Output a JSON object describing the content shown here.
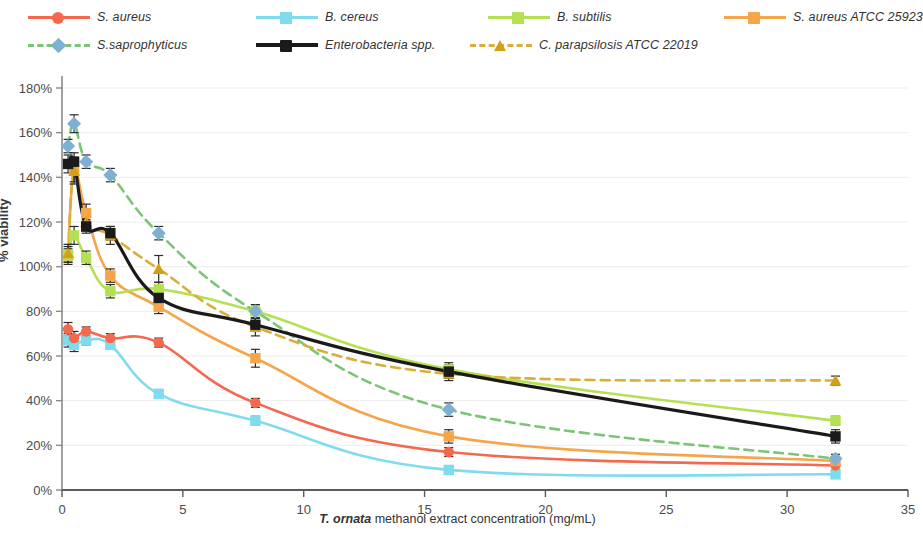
{
  "chart_data": {
    "type": "line",
    "title": "",
    "xlabel": "T. ornata methanol extract concentration (mg/mL)",
    "ylabel": "% viability",
    "xlim": [
      0,
      35
    ],
    "ylim": [
      0,
      180
    ],
    "xticks": [
      0,
      5,
      10,
      15,
      20,
      25,
      30,
      35
    ],
    "xtick_labels": [
      "0",
      "5",
      "10",
      "15",
      "20",
      "25",
      "30",
      "35"
    ],
    "yticks": [
      0,
      20,
      40,
      60,
      80,
      100,
      120,
      140,
      160,
      180
    ],
    "ytick_labels": [
      "0%",
      "20%",
      "40%",
      "60%",
      "80%",
      "100%",
      "120%",
      "140%",
      "160%",
      "180%"
    ],
    "grid": "horizontal",
    "legend_position": "top",
    "x": [
      0.25,
      0.5,
      1,
      2,
      4,
      8,
      16,
      32
    ],
    "series": [
      {
        "name": "S. aureus",
        "color": "#F4694E",
        "marker": "circle",
        "line": "solid",
        "values": [
          72,
          68,
          71,
          68,
          66,
          39,
          17,
          11
        ],
        "errors": [
          3,
          3,
          2,
          2,
          2,
          2,
          2,
          2
        ]
      },
      {
        "name": "B. cereus",
        "color": "#7FDCEF",
        "marker": "square",
        "line": "solid",
        "values": [
          67,
          65,
          67,
          65,
          43,
          31,
          9,
          7
        ],
        "errors": [
          3,
          3,
          2,
          2,
          2,
          2,
          1,
          1
        ]
      },
      {
        "name": "B. subtilis",
        "color": "#B5E053",
        "marker": "square",
        "line": "solid",
        "values": [
          105,
          114,
          104,
          89,
          90,
          80,
          54,
          31
        ],
        "errors": [
          3,
          4,
          3,
          3,
          3,
          3,
          3,
          2
        ]
      },
      {
        "name": "S. aureus ATCC 25923",
        "color": "#F5A64B",
        "marker": "square",
        "line": "solid",
        "values": [
          105,
          143,
          124,
          96,
          82,
          59,
          24,
          13
        ],
        "errors": [
          4,
          5,
          4,
          3,
          3,
          4,
          3,
          2
        ]
      },
      {
        "name": "S.saprophyticus",
        "color": "#7CC576",
        "marker_color": "#7FB0D4",
        "marker": "diamond",
        "line": "dashed",
        "values": [
          154,
          164,
          147,
          141,
          115,
          80,
          36,
          14
        ],
        "errors": [
          3,
          4,
          3,
          3,
          3,
          3,
          3,
          2
        ]
      },
      {
        "name": "Enterobacteria spp.",
        "color": "#1A1A1A",
        "marker": "square",
        "line": "solid",
        "values": [
          146,
          147,
          118,
          115,
          86,
          74,
          53,
          24
        ],
        "errors": [
          4,
          4,
          3,
          3,
          3,
          3,
          3,
          3
        ]
      },
      {
        "name": "C. parapsilosis ATCC 22019",
        "color": "#D9AE3A",
        "marker_color": "#D4A017",
        "marker": "triangle",
        "line": "dashed",
        "values": [
          106,
          143,
          120,
          114,
          99,
          73,
          52,
          49
        ],
        "errors": [
          4,
          6,
          4,
          4,
          6,
          4,
          3,
          2
        ]
      }
    ]
  },
  "legend": {
    "items": [
      {
        "label": "S. aureus",
        "name": "legend-s-aureus"
      },
      {
        "label": "B. cereus",
        "name": "legend-b-cereus"
      },
      {
        "label": "B. subtilis",
        "name": "legend-b-subtilis"
      },
      {
        "label": "S. aureus ATCC 25923",
        "name": "legend-s-aureus-atcc-25923"
      },
      {
        "label": "S.saprophyticus",
        "name": "legend-s-saprophyticus"
      },
      {
        "label": "Enterobacteria spp.",
        "name": "legend-enterobacteria-spp"
      },
      {
        "label": "C. parapsilosis ATCC 22019",
        "name": "legend-c-parapsilosis-atcc-22019"
      }
    ]
  },
  "axes": {
    "y_title": "% viability",
    "x_title_italic": "T. ornata",
    "x_title_rest": " methanol extract concentration (mg/mL)"
  }
}
